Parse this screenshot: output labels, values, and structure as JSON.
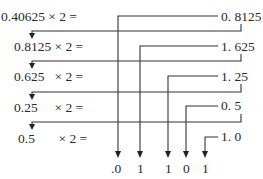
{
  "steps": [
    {
      "expr": "0.40625 × 2 =",
      "result": "0. 8125"
    },
    {
      "expr": "0.8125 × 2 =",
      "result": "1. 625"
    },
    {
      "expr": "0.625   × 2 =",
      "result": "1. 25"
    },
    {
      "expr": "0.25     × 2 =",
      "result": "0. 5"
    },
    {
      "expr": "0.5       × 2 =",
      "result": "1. 0"
    }
  ],
  "binary_digits": [
    ".0",
    "1",
    "1",
    "0",
    "1"
  ],
  "colors": {
    "line": "#333333",
    "text": "#2a2a2a",
    "background": "#ffffff"
  }
}
